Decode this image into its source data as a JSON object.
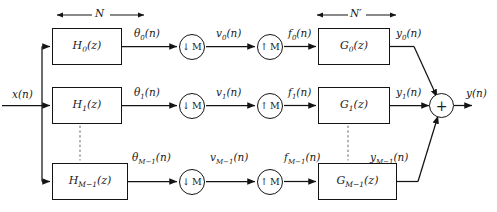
{
  "figure": {
    "kind": "block-diagram",
    "input_label": "x(n)",
    "output_label": "y(n)",
    "adder_symbol": "+",
    "dimension_left": "N",
    "dimension_right": "N′",
    "downsample_symbol": "↓",
    "upsample_symbol": "↑",
    "rate_factor": "M",
    "line_color": "#141414",
    "background": "#ffffff"
  },
  "channels": [
    {
      "analysis_filter": "H",
      "analysis_sub": "0",
      "analysis_arg": "(z)",
      "analysis_signal": "θ",
      "analysis_signal_sub": "0",
      "analysis_signal_arg": "(n)",
      "decimated_signal": "v",
      "decimated_signal_sub": "0",
      "decimated_signal_arg": "(n)",
      "interpolated_signal": "f",
      "interpolated_signal_sub": "0",
      "interpolated_signal_arg": "(n)",
      "synthesis_filter": "G",
      "synthesis_sub": "0",
      "synthesis_arg": "(z)",
      "output_signal": "y",
      "output_signal_sub": "0",
      "output_signal_arg": "(n)"
    },
    {
      "analysis_filter": "H",
      "analysis_sub": "1",
      "analysis_arg": "(z)",
      "analysis_signal": "θ",
      "analysis_signal_sub": "1",
      "analysis_signal_arg": "(n)",
      "decimated_signal": "v",
      "decimated_signal_sub": "1",
      "decimated_signal_arg": "(n)",
      "interpolated_signal": "f",
      "interpolated_signal_sub": "1",
      "interpolated_signal_arg": "(n)",
      "synthesis_filter": "G",
      "synthesis_sub": "1",
      "synthesis_arg": "(z)",
      "output_signal": "y",
      "output_signal_sub": "1",
      "output_signal_arg": "(n)"
    },
    {
      "analysis_filter": "H",
      "analysis_sub": "M−1",
      "analysis_arg": "(z)",
      "analysis_signal": "θ",
      "analysis_signal_sub": "M−1",
      "analysis_signal_arg": "(n)",
      "decimated_signal": "v",
      "decimated_signal_sub": "M−1",
      "decimated_signal_arg": "(n)",
      "interpolated_signal": "f",
      "interpolated_signal_sub": "M−1",
      "interpolated_signal_arg": "(n)",
      "synthesis_filter": "G",
      "synthesis_sub": "M−1",
      "synthesis_arg": "(z)",
      "output_signal": "y",
      "output_signal_sub": "M−1",
      "output_signal_arg": "(n)"
    }
  ]
}
